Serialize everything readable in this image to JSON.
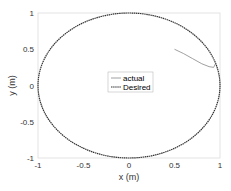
{
  "chart_data": {
    "type": "line",
    "title": "",
    "xlabel": "x (m)",
    "ylabel": "y (m)",
    "xlim": [
      -1,
      1
    ],
    "ylim": [
      -1,
      1
    ],
    "xticks": [
      "-1",
      "-0.5",
      "0",
      "0.5",
      "1"
    ],
    "yticks": [
      "-1",
      "-0.5",
      "0",
      "0.5",
      "1"
    ],
    "grid": false,
    "legend_position": "center",
    "series": [
      {
        "name": "actual",
        "style": "solid",
        "color": "#888888",
        "x": [
          0.5,
          0.6,
          0.7,
          0.8,
          0.88,
          0.93,
          0.95
        ],
        "y": [
          0.5,
          0.44,
          0.37,
          0.3,
          0.26,
          0.25,
          0.3
        ]
      },
      {
        "name": "Desired",
        "style": "dashed",
        "color": "#333333",
        "shape": "unit circle",
        "center": [
          0,
          0
        ],
        "radius": 1
      }
    ]
  }
}
